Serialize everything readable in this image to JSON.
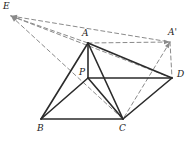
{
  "figure": {
    "kind": "geometry-diagram",
    "canvas": {
      "width": 193,
      "height": 144,
      "background": "#ffffff"
    },
    "style": {
      "solid_color": "#2b2b2b",
      "dashed_color": "#8a8a8a",
      "solid_width": 1.6,
      "dashed_width": 1.0,
      "dash_pattern": "4,3",
      "label_color": "#1c1c1c",
      "label_font_size": "9px"
    },
    "points": [
      {
        "id": "E",
        "label": "E",
        "x": 11,
        "y": 16,
        "label_x": 3,
        "label_y": 2
      },
      {
        "id": "A",
        "label": "A",
        "x": 88,
        "y": 43,
        "label_x": 82,
        "label_y": 29
      },
      {
        "id": "Ap",
        "label": "A'",
        "x": 170,
        "y": 42,
        "label_x": 168,
        "label_y": 28
      },
      {
        "id": "P",
        "label": "P",
        "x": 88,
        "y": 78,
        "label_x": 79,
        "label_y": 68
      },
      {
        "id": "D",
        "label": "D",
        "x": 172,
        "y": 78,
        "label_x": 177,
        "label_y": 70
      },
      {
        "id": "B",
        "label": "B",
        "x": 41,
        "y": 119,
        "label_x": 37,
        "label_y": 124
      },
      {
        "id": "C",
        "label": "C",
        "x": 123,
        "y": 119,
        "label_x": 119,
        "label_y": 124
      }
    ],
    "solid_edges": [
      {
        "from": "A",
        "to": "B"
      },
      {
        "from": "A",
        "to": "C"
      },
      {
        "from": "A",
        "to": "D"
      },
      {
        "from": "A",
        "to": "P"
      },
      {
        "from": "B",
        "to": "C"
      },
      {
        "from": "B",
        "to": "P"
      },
      {
        "from": "P",
        "to": "C"
      },
      {
        "from": "P",
        "to": "D"
      },
      {
        "from": "C",
        "to": "D"
      }
    ],
    "dashed_edges": [
      {
        "from": "E",
        "to": "A"
      },
      {
        "from": "E",
        "to": "Ap"
      },
      {
        "from": "E",
        "to": "D"
      },
      {
        "from": "E",
        "to": "C"
      },
      {
        "from": "A",
        "to": "Ap"
      },
      {
        "from": "Ap",
        "to": "D"
      },
      {
        "from": "Ap",
        "to": "C"
      }
    ],
    "arrow_heads": [
      {
        "at": "E",
        "from": "A"
      },
      {
        "at": "E",
        "from": "Ap"
      },
      {
        "at": "E",
        "from": "D"
      },
      {
        "at": "E",
        "from": "C"
      },
      {
        "at": "Ap",
        "from": "A"
      },
      {
        "at": "Ap",
        "from": "C"
      }
    ]
  }
}
